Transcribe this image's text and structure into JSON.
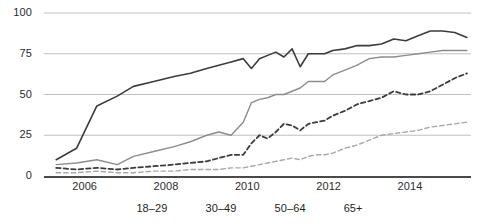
{
  "chart_data": {
    "type": "line",
    "title": "",
    "subtitle": "",
    "xlabel": "",
    "ylabel": "",
    "xlim": [
      2005,
      2015.5
    ],
    "ylim": [
      0,
      100
    ],
    "grid": true,
    "legend_position": "bottom",
    "ytick_labels": [
      "0",
      "25",
      "50",
      "75",
      "100"
    ],
    "ytick_values": [
      0,
      25,
      50,
      75,
      100
    ],
    "xtick_labels": [
      "2006",
      "2008",
      "2010",
      "2012",
      "2014"
    ],
    "xtick_values": [
      2006,
      2008,
      2010,
      2012,
      2014
    ],
    "series": [
      {
        "name": "18–29",
        "color": "#3c3c3c",
        "style": "solid",
        "width": 1.6,
        "x": [
          2005.3,
          2005.8,
          2006.3,
          2006.8,
          2007.2,
          2007.7,
          2008.2,
          2008.6,
          2009.0,
          2009.3,
          2009.6,
          2009.9,
          2010.1,
          2010.3,
          2010.5,
          2010.7,
          2010.9,
          2011.1,
          2011.3,
          2011.5,
          2011.7,
          2011.9,
          2012.1,
          2012.4,
          2012.7,
          2013.0,
          2013.3,
          2013.6,
          2013.9,
          2014.2,
          2014.5,
          2014.8,
          2015.1,
          2015.4
        ],
        "values": [
          10,
          17,
          43,
          49,
          55,
          58,
          61,
          63,
          66,
          68,
          70,
          72,
          66,
          72,
          74,
          76,
          73,
          78,
          67,
          75,
          75,
          75,
          77,
          78,
          80,
          80,
          81,
          84,
          83,
          86,
          89,
          89,
          88,
          85
        ]
      },
      {
        "name": "30–49",
        "color": "#8c8c8c",
        "style": "solid",
        "width": 1.4,
        "x": [
          2005.3,
          2005.8,
          2006.3,
          2006.8,
          2007.2,
          2007.7,
          2008.2,
          2008.6,
          2009.0,
          2009.3,
          2009.6,
          2009.9,
          2010.1,
          2010.3,
          2010.5,
          2010.7,
          2010.9,
          2011.1,
          2011.3,
          2011.5,
          2011.7,
          2011.9,
          2012.1,
          2012.4,
          2012.7,
          2013.0,
          2013.3,
          2013.6,
          2013.9,
          2014.2,
          2014.5,
          2014.8,
          2015.1,
          2015.4
        ],
        "values": [
          7,
          8,
          10,
          7,
          12,
          15,
          18,
          21,
          25,
          27,
          25,
          33,
          45,
          47,
          48,
          50,
          50,
          52,
          54,
          58,
          58,
          58,
          62,
          65,
          68,
          72,
          73,
          73,
          74,
          75,
          76,
          77,
          77,
          77
        ]
      },
      {
        "name": "50–64",
        "color": "#3c3c3c",
        "style": "dashed",
        "width": 1.8,
        "x": [
          2005.3,
          2005.8,
          2006.3,
          2006.8,
          2007.2,
          2007.7,
          2008.2,
          2008.6,
          2009.0,
          2009.3,
          2009.6,
          2009.9,
          2010.1,
          2010.3,
          2010.5,
          2010.7,
          2010.9,
          2011.1,
          2011.3,
          2011.5,
          2011.7,
          2011.9,
          2012.1,
          2012.4,
          2012.7,
          2013.0,
          2013.3,
          2013.6,
          2013.9,
          2014.2,
          2014.5,
          2014.8,
          2015.1,
          2015.4
        ],
        "values": [
          5,
          4,
          5,
          4,
          5,
          6,
          7,
          8,
          9,
          11,
          13,
          13,
          20,
          25,
          23,
          27,
          32,
          31,
          28,
          32,
          33,
          34,
          37,
          40,
          44,
          46,
          48,
          52,
          50,
          50,
          52,
          56,
          60,
          63
        ]
      },
      {
        "name": "65+",
        "color": "#a8a8a8",
        "style": "dashed",
        "width": 1.4,
        "x": [
          2005.3,
          2005.8,
          2006.3,
          2006.8,
          2007.2,
          2007.7,
          2008.2,
          2008.6,
          2009.0,
          2009.3,
          2009.6,
          2009.9,
          2010.1,
          2010.3,
          2010.5,
          2010.7,
          2010.9,
          2011.1,
          2011.3,
          2011.5,
          2011.7,
          2011.9,
          2012.1,
          2012.4,
          2012.7,
          2013.0,
          2013.3,
          2013.6,
          2013.9,
          2014.2,
          2014.5,
          2014.8,
          2015.1,
          2015.4
        ],
        "values": [
          2,
          2,
          3,
          2,
          2,
          3,
          3,
          4,
          4,
          4,
          5,
          5,
          6,
          7,
          8,
          9,
          10,
          11,
          10,
          12,
          13,
          13,
          14,
          17,
          19,
          22,
          25,
          26,
          27,
          28,
          30,
          31,
          32,
          33
        ]
      }
    ]
  },
  "axes": {
    "yticks": [
      {
        "label": "100",
        "value": 100
      },
      {
        "label": "75",
        "value": 75
      },
      {
        "label": "50",
        "value": 50
      },
      {
        "label": "25",
        "value": 25
      },
      {
        "label": "0",
        "value": 0
      }
    ],
    "xticks": [
      {
        "label": "2006",
        "value": 2006
      },
      {
        "label": "2008",
        "value": 2008
      },
      {
        "label": "2010",
        "value": 2010
      },
      {
        "label": "2012",
        "value": 2012
      },
      {
        "label": "2014",
        "value": 2014
      }
    ]
  },
  "legend": {
    "items": [
      {
        "label": "18–29",
        "color": "#3c3c3c",
        "style": "solid"
      },
      {
        "label": "30–49",
        "color": "#8c8c8c",
        "style": "solid"
      },
      {
        "label": "50–64",
        "color": "#3c3c3c",
        "style": "dashed"
      },
      {
        "label": "65+",
        "color": "#a8a8a8",
        "style": "dashed"
      }
    ]
  },
  "colors": {
    "gridline": "#b9b9b9",
    "axis": "#4a4a4a",
    "background": "#ffffff",
    "text": "#231f20"
  }
}
